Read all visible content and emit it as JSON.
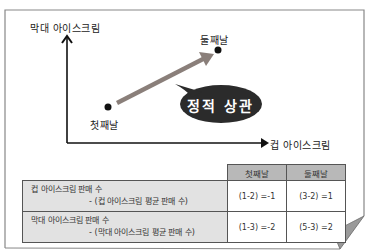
{
  "diagram": {
    "y_axis_label": "막대 아이스크림",
    "x_axis_label": "컵 아이스크림",
    "points": [
      {
        "label": "첫째날",
        "x": 108,
        "y": 107
      },
      {
        "label": "둘째날",
        "x": 218,
        "y": 50
      }
    ],
    "bubble_text": "정적 상관",
    "colors": {
      "axis": "#111111",
      "arrow": "#8a7f7a",
      "bubble": "#2b2b2b",
      "table_header": "#b8b8b8",
      "table_rowlabel": "#e2e2e2",
      "frame": "#888888"
    }
  },
  "table": {
    "headers": [
      "첫째날",
      "둘째날"
    ],
    "rows": [
      {
        "label_line1": "컵 아이스크림 판매 수",
        "label_line2": "- (컵 아이스크림 평균 판매 수)",
        "values": [
          "(1-2) =-1",
          "(3-2) =1"
        ]
      },
      {
        "label_line1": "막대 아이스크림 판매 수",
        "label_line2": "- (막대 아이스크림 평균 판매 수)",
        "values": [
          "(1-3) =-2",
          "(5-3) =2"
        ]
      }
    ]
  }
}
